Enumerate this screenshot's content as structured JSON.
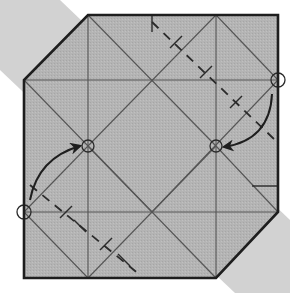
{
  "diagram": {
    "type": "origami-fold-step",
    "colors": {
      "background": "#ffffff",
      "paper": "#b4b4b4",
      "shadow": "#d2d2d2",
      "edge": "#1e1e1e",
      "crease": "#555555",
      "fold_line": "#2a2a2a"
    },
    "shadow_band": [
      [
        0,
        0
      ],
      [
        60,
        0
      ],
      [
        290,
        220
      ],
      [
        290,
        293
      ],
      [
        235,
        293
      ],
      [
        0,
        70
      ]
    ],
    "paper_outline": [
      [
        88,
        15
      ],
      [
        278,
        15
      ],
      [
        278,
        212
      ],
      [
        216,
        278
      ],
      [
        24,
        278
      ],
      [
        24,
        80
      ]
    ],
    "creases": [
      [
        88,
        15,
        88,
        278
      ],
      [
        216,
        15,
        216,
        278
      ],
      [
        24,
        80,
        278,
        80
      ],
      [
        24,
        212,
        278,
        212
      ],
      [
        88,
        15,
        24,
        80
      ],
      [
        88,
        15,
        216,
        146
      ],
      [
        216,
        15,
        88,
        146
      ],
      [
        216,
        15,
        278,
        80
      ],
      [
        24,
        80,
        152,
        212
      ],
      [
        278,
        80,
        152,
        212
      ],
      [
        24,
        212,
        88,
        146
      ],
      [
        24,
        212,
        88,
        278
      ],
      [
        216,
        146,
        278,
        212
      ],
      [
        216,
        278,
        278,
        212
      ],
      [
        88,
        146,
        216,
        278
      ],
      [
        216,
        146,
        88,
        278
      ]
    ],
    "valley_folds": [
      [
        30,
        185,
        140,
        275
      ],
      [
        152,
        22,
        275,
        140
      ]
    ],
    "ticks": [
      [
        152,
        15,
        152,
        32
      ],
      [
        252,
        186,
        278,
        186
      ],
      [
        74,
        220,
        86,
        232
      ],
      [
        118,
        254,
        130,
        266
      ],
      [
        170,
        48,
        182,
        36
      ],
      [
        200,
        78,
        212,
        66
      ],
      [
        230,
        108,
        242,
        96
      ],
      [
        60,
        218,
        72,
        206
      ],
      [
        100,
        250,
        112,
        238
      ]
    ],
    "reference_circles": [
      {
        "id": "left-edge-point",
        "cx": 24,
        "cy": 212,
        "r": 7
      },
      {
        "id": "right-edge-point",
        "cx": 278,
        "cy": 80,
        "r": 7
      },
      {
        "id": "left-target",
        "cx": 88,
        "cy": 146,
        "r": 6
      },
      {
        "id": "right-target",
        "cx": 216,
        "cy": 146,
        "r": 6
      }
    ],
    "arrows": [
      {
        "id": "arrow-left",
        "path": "M 30 200 Q 38 158 80 146",
        "head": [
          80,
          146
        ]
      },
      {
        "id": "arrow-right",
        "path": "M 272 94 Q 270 140 224 147",
        "head": [
          224,
          147
        ]
      }
    ]
  }
}
